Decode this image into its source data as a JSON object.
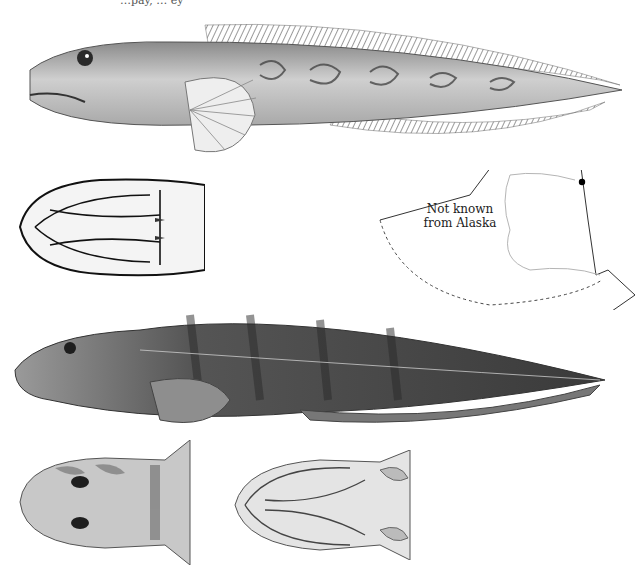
{
  "page": {
    "caption_fragment": "…pay, … ey",
    "background": "#ffffff"
  },
  "figures": [
    {
      "id": "fig-lateral-top",
      "subject": "fish lateral view (pale, with reticulated dark markings)",
      "tone": "light"
    },
    {
      "id": "fig-ventral-head-top",
      "subject": "ventral view of head, line drawing",
      "tone": "line-art"
    },
    {
      "id": "fig-lateral-bottom",
      "subject": "fish lateral view (dark, banded, finely spotted)",
      "tone": "dark"
    },
    {
      "id": "fig-dorsal-head",
      "subject": "dorsal view of head with eyes",
      "tone": "medium"
    },
    {
      "id": "fig-ventral-head-bottom",
      "subject": "ventral view of head",
      "tone": "light"
    }
  ],
  "range_map": {
    "label_line1": "Not known",
    "label_line2": "from Alaska",
    "marker": "record-point",
    "marker_color": "#000000",
    "line_color": "#333333",
    "coast_color": "#b5b5b5"
  }
}
